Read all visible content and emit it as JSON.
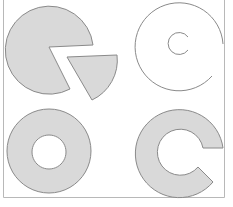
{
  "diagram": {
    "title": "",
    "style": {
      "fill": "#d9d9d9",
      "stroke": "#8a8a8a",
      "frame_stroke": "#b0b0b0",
      "background": "#ffffff"
    },
    "shapes": [
      {
        "id": "pie-with-wedge",
        "description": "Filled circle with a wedge removed; the removed wedge shown detached to the lower right",
        "position": "top-left"
      },
      {
        "id": "open-ring-outline",
        "description": "Outlined open ring (C-shaped) with a small inner open circle, unfilled",
        "position": "top-right"
      },
      {
        "id": "donut",
        "description": "Filled annulus (donut) with a white center hole",
        "position": "bottom-left"
      },
      {
        "id": "c-ring",
        "description": "Filled C-shaped partial annulus opening to the right",
        "position": "bottom-right"
      }
    ]
  }
}
